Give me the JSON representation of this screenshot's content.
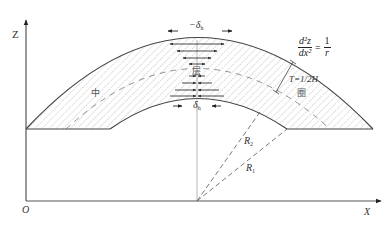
{
  "axes": {
    "z_label": "Z",
    "x_label": "X",
    "origin_label": "O"
  },
  "labels": {
    "delta_top": "−δ",
    "delta_top_sub": "h",
    "delta_bottom": "δ",
    "delta_bottom_sub": "h",
    "r1": "R",
    "r1_sub": "1",
    "r2": "R",
    "r2_sub": "2",
    "thickness": "T=1/2H",
    "neutral_char": "中",
    "layer_char": "层",
    "circle_char": "圈"
  },
  "equation": {
    "numerator": "d²z",
    "denominator": "dx²",
    "equals": "=",
    "rhs_num": "1",
    "rhs_den": "r"
  },
  "colors": {
    "line": "#444444",
    "axis": "#555555",
    "hatch": "#888888",
    "dash": "#666666",
    "background": "#ffffff"
  }
}
